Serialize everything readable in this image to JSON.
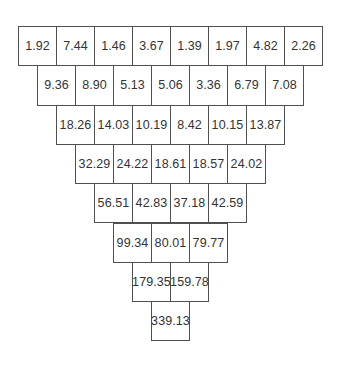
{
  "pyramid": {
    "layout": {
      "left": 18,
      "top": 26,
      "cell_width": 38,
      "row_height": 39.3
    },
    "colors": {
      "border": "#505050",
      "text": "#333333",
      "background": "#ffffff"
    },
    "rows": [
      [
        "1.92",
        "7.44",
        "1.46",
        "3.67",
        "1.39",
        "1.97",
        "4.82",
        "2.26"
      ],
      [
        "9.36",
        "8.90",
        "5.13",
        "5.06",
        "3.36",
        "6.79",
        "7.08"
      ],
      [
        "18.26",
        "14.03",
        "10.19",
        "8.42",
        "10.15",
        "13.87"
      ],
      [
        "32.29",
        "24.22",
        "18.61",
        "18.57",
        "24.02"
      ],
      [
        "56.51",
        "42.83",
        "37.18",
        "42.59"
      ],
      [
        "99.34",
        "80.01",
        "79.77"
      ],
      [
        "179.35",
        "159.78"
      ],
      [
        "339.13"
      ]
    ]
  }
}
